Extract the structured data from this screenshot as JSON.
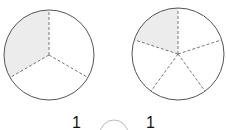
{
  "figures": [
    {
      "name": "circle-thirds",
      "parts": 3,
      "shaded": 1,
      "cx": 49,
      "cy": 55,
      "r": 45
    },
    {
      "name": "circle-fifths",
      "parts": 5,
      "shaded": 1,
      "cx": 178,
      "cy": 54,
      "r": 46
    }
  ],
  "comparison": {
    "left_numerator": "1",
    "right_numerator": "1",
    "blank_symbol": ""
  },
  "colors": {
    "shade": "#ececec",
    "outline": "#555555",
    "dash": "#777777"
  }
}
